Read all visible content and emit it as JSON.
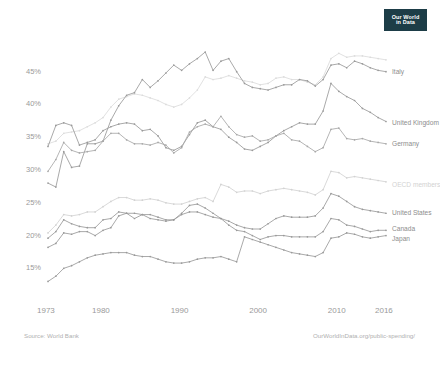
{
  "logo": {
    "line1": "Our World",
    "line2": "in Data",
    "bg": "#1d3d47"
  },
  "footer": {
    "source": "Source: World Bank",
    "url": "OurWorldInData.org/public-spending/"
  },
  "axes": {
    "y_ticks": [
      "15%",
      "20%",
      "25%",
      "30%",
      "35%",
      "40%",
      "45%"
    ],
    "x_ticks": [
      "1973",
      "1980",
      "1990",
      "2000",
      "2010",
      "2016"
    ]
  },
  "chart_data": {
    "type": "line",
    "title": "",
    "subtitle": "",
    "xlabel": "",
    "ylabel": "",
    "xlim": [
      1973,
      2016
    ],
    "ylim": [
      12,
      48
    ],
    "grid": false,
    "legend": "right-end-labels",
    "x": [
      1973,
      1974,
      1975,
      1976,
      1977,
      1978,
      1979,
      1980,
      1981,
      1982,
      1983,
      1984,
      1985,
      1986,
      1987,
      1988,
      1989,
      1990,
      1991,
      1992,
      1993,
      1994,
      1995,
      1996,
      1997,
      1998,
      1999,
      2000,
      2001,
      2002,
      2003,
      2004,
      2005,
      2006,
      2007,
      2008,
      2009,
      2010,
      2011,
      2012,
      2013,
      2014,
      2015,
      2016
    ],
    "series": [
      {
        "name": "France",
        "color": "#dcdcdc",
        "label_visible": false,
        "values": [
          34.0,
          34.4,
          35.6,
          35.8,
          36.0,
          36.6,
          37.2,
          38.0,
          39.6,
          40.8,
          41.2,
          41.6,
          41.4,
          41.0,
          40.6,
          40.0,
          39.6,
          40.0,
          41.0,
          42.2,
          44.2,
          43.8,
          44.0,
          44.4,
          44.0,
          43.6,
          43.4,
          43.0,
          43.2,
          44.0,
          44.2,
          43.8,
          43.8,
          43.4,
          43.0,
          44.2,
          47.0,
          47.8,
          47.2,
          47.4,
          47.4,
          47.2,
          47.0,
          46.8
        ]
      },
      {
        "name": "Italy",
        "color": "#9a9a9a",
        "label_visible": true,
        "values": [
          28.0,
          27.4,
          32.8,
          30.4,
          30.6,
          34.0,
          34.0,
          34.4,
          37.6,
          39.8,
          41.4,
          41.8,
          43.8,
          42.6,
          43.6,
          44.8,
          46.0,
          45.2,
          46.2,
          47.0,
          48.0,
          45.2,
          46.6,
          47.0,
          45.0,
          43.2,
          42.6,
          42.4,
          42.2,
          42.6,
          43.0,
          43.0,
          43.8,
          43.6,
          42.8,
          43.8,
          46.0,
          46.2,
          45.6,
          46.6,
          46.2,
          45.6,
          45.2,
          45.0
        ]
      },
      {
        "name": "United Kingdom",
        "color": "#9a9a9a",
        "label_visible": true,
        "values": [
          33.6,
          36.8,
          37.2,
          36.8,
          33.8,
          34.2,
          34.6,
          36.0,
          36.6,
          37.0,
          37.2,
          37.0,
          36.0,
          36.2,
          35.2,
          33.4,
          33.0,
          33.6,
          35.4,
          37.2,
          37.6,
          36.6,
          36.2,
          35.0,
          34.2,
          33.2,
          33.0,
          33.6,
          34.2,
          35.2,
          36.0,
          36.6,
          37.2,
          37.0,
          37.0,
          39.0,
          43.2,
          42.0,
          41.2,
          40.6,
          39.4,
          38.8,
          38.0,
          37.4
        ]
      },
      {
        "name": "Germany",
        "color": "#a8a8a8",
        "label_visible": true,
        "values": [
          29.8,
          31.6,
          34.2,
          33.0,
          32.6,
          32.8,
          33.0,
          34.4,
          35.6,
          35.6,
          34.6,
          34.0,
          34.0,
          33.8,
          34.2,
          33.8,
          32.6,
          33.4,
          35.8,
          36.6,
          37.0,
          36.6,
          38.2,
          36.6,
          35.4,
          35.0,
          35.2,
          34.4,
          34.6,
          35.2,
          35.6,
          34.6,
          34.4,
          33.6,
          32.8,
          33.4,
          36.2,
          36.4,
          34.8,
          34.6,
          34.8,
          34.4,
          34.2,
          34.0
        ]
      },
      {
        "name": "OECD members",
        "color": "#d2d2d2",
        "label_visible": true,
        "values": [
          20.4,
          21.6,
          23.2,
          23.0,
          23.2,
          23.6,
          23.6,
          24.4,
          25.2,
          25.8,
          25.8,
          25.4,
          25.4,
          25.6,
          25.4,
          25.0,
          24.8,
          24.8,
          25.2,
          25.6,
          25.8,
          25.2,
          27.8,
          27.4,
          26.6,
          26.8,
          26.8,
          26.4,
          26.8,
          27.0,
          27.2,
          27.0,
          26.8,
          26.6,
          26.2,
          27.0,
          29.8,
          29.6,
          28.8,
          29.0,
          28.8,
          28.6,
          28.4,
          28.2
        ]
      },
      {
        "name": "United States",
        "color": "#9a9a9a",
        "label_visible": true,
        "values": [
          19.6,
          20.6,
          22.4,
          21.8,
          21.4,
          21.2,
          21.2,
          22.4,
          22.6,
          23.6,
          23.4,
          22.6,
          23.2,
          23.2,
          22.8,
          22.4,
          22.4,
          23.2,
          23.6,
          23.6,
          23.2,
          22.8,
          22.6,
          22.2,
          21.6,
          21.2,
          21.0,
          21.0,
          21.8,
          22.6,
          23.0,
          22.8,
          22.8,
          22.8,
          23.0,
          24.2,
          26.4,
          26.0,
          25.2,
          24.4,
          24.0,
          23.8,
          23.6,
          23.4
        ]
      },
      {
        "name": "Canada",
        "color": "#9a9a9a",
        "label_visible": true,
        "values": [
          18.2,
          18.8,
          20.4,
          20.2,
          20.6,
          20.6,
          20.0,
          20.8,
          21.2,
          23.0,
          23.4,
          23.4,
          23.2,
          22.6,
          22.4,
          22.2,
          22.4,
          23.4,
          24.6,
          24.8,
          24.2,
          23.4,
          22.6,
          21.6,
          20.8,
          20.6,
          20.0,
          19.4,
          19.8,
          20.0,
          20.0,
          19.8,
          19.8,
          19.8,
          19.8,
          20.6,
          22.6,
          22.4,
          21.6,
          21.4,
          21.0,
          20.6,
          20.8,
          20.8
        ]
      },
      {
        "name": "Japan",
        "color": "#9a9a9a",
        "label_visible": true,
        "values": [
          13.0,
          13.8,
          15.0,
          15.4,
          16.0,
          16.6,
          17.0,
          17.2,
          17.4,
          17.4,
          17.4,
          17.0,
          16.8,
          16.8,
          16.4,
          16.0,
          15.8,
          15.8,
          16.0,
          16.4,
          16.6,
          16.6,
          16.8,
          16.4,
          16.0,
          19.8,
          19.4,
          19.0,
          18.6,
          18.2,
          17.8,
          17.4,
          17.2,
          17.0,
          16.8,
          17.4,
          19.6,
          19.8,
          20.4,
          20.2,
          19.8,
          19.6,
          19.8,
          20.0
        ]
      }
    ],
    "end_labels": [
      {
        "name": "Italy",
        "y_pct": 45.0
      },
      {
        "name": "United Kingdom",
        "y_pct": 37.4
      },
      {
        "name": "Germany",
        "y_pct": 34.0
      },
      {
        "name": "OECD members",
        "y_pct": 28.2
      },
      {
        "name": "United States",
        "y_pct": 23.4
      },
      {
        "name": "Canada",
        "y_pct": 20.8
      },
      {
        "name": "Japan",
        "y_pct": 20.0
      }
    ]
  }
}
